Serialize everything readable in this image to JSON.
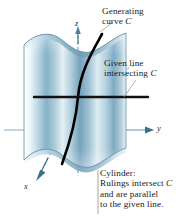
{
  "figure": {
    "background_color": "#ffffff"
  },
  "annotations": {
    "generating_curve": {
      "line1": "Generating",
      "line2_prefix": "curve ",
      "line2_italic": "C"
    },
    "given_line": {
      "line1": "Given line",
      "line2_prefix": "intersecting ",
      "line2_italic": "C"
    },
    "cylinder_caption": {
      "line1": "Cylinder:",
      "line2_prefix": "Rulings intersect ",
      "line2_italic": "C",
      "line3": "and are parallel",
      "line4": "to the given line."
    }
  },
  "axes": {
    "z": "z",
    "y": "y",
    "x": "x",
    "axis_color": "#5f93ae",
    "origin": {
      "x": 78,
      "y": 97
    }
  },
  "geometry": {
    "generating_curve_color": "#000000",
    "generating_curve_width": 2.6,
    "given_line_color": "#111111",
    "given_line_width": 2.4,
    "given_line_y": 97,
    "given_line_x_start": 34,
    "given_line_x_end": 148,
    "surface_fill_light": "#eef5f8",
    "surface_fill_mid": "#9dc2d4",
    "surface_fill_dark": "#4e7f9b",
    "surface_edge_color": "#3f6f8a",
    "leader_line_color": "#8a8a8a"
  }
}
